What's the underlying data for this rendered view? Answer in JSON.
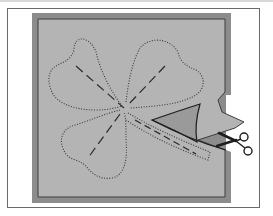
{
  "figure": {
    "elements": {
      "frame": "outer-frame",
      "fabric": "fabric-block",
      "shamrock": "shamrock-outline",
      "cut_flap": "cut-fabric-flap",
      "scissors": "scissors-icon"
    }
  },
  "colors": {
    "background": "#ffffff",
    "frame_border": "#6a6a6a",
    "fabric_fill": "#b4b4b4",
    "fabric_border": "#5a5a5a",
    "fabric_rim": "#8c8c8c",
    "revealed_under": "#9a9a9a",
    "stitch": "#3a3a3a",
    "ink": "#1e1e1e"
  }
}
